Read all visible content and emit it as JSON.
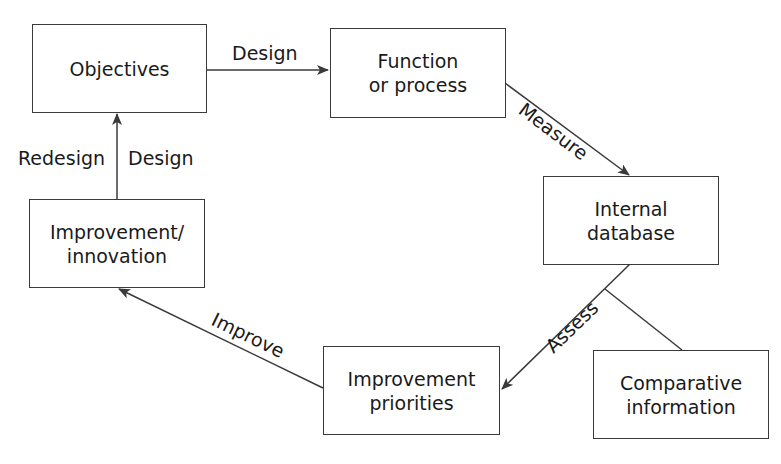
{
  "nodes": {
    "objectives": {
      "lines": [
        "Objectives"
      ]
    },
    "function": {
      "lines": [
        "Function",
        "or process"
      ]
    },
    "internal_db": {
      "lines": [
        "Internal",
        "database"
      ]
    },
    "comparative": {
      "lines": [
        "Comparative",
        "information"
      ]
    },
    "priorities": {
      "lines": [
        "Improvement",
        "priorities"
      ]
    },
    "innovation": {
      "lines": [
        "Improvement/",
        "innovation"
      ]
    }
  },
  "edges": {
    "design_top": "Design",
    "measure": "Measure",
    "assess": "Assess",
    "improve": "Improve",
    "redesign": "Redesign",
    "design_left": "Design"
  },
  "colors": {
    "stroke": "#3a3a3a",
    "text": "#1a1a1a",
    "background": "#ffffff"
  }
}
